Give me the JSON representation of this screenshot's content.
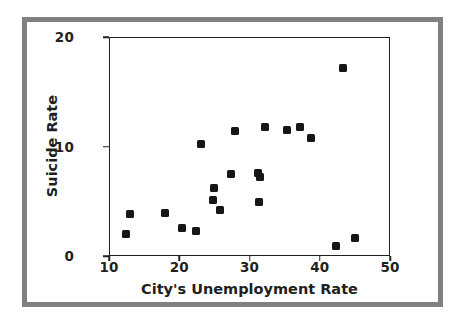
{
  "chart_data": {
    "type": "scatter",
    "title": "",
    "xlabel": "City's Unemployment Rate",
    "ylabel": "Suicide Rate",
    "xlim": [
      10,
      50
    ],
    "ylim": [
      0,
      20
    ],
    "xticks": [
      10,
      20,
      30,
      40,
      50
    ],
    "yticks": [
      0,
      10,
      20
    ],
    "xtick_labels": [
      "10",
      "20",
      "30",
      "40",
      "50"
    ],
    "ytick_labels": [
      "0",
      "10",
      "20"
    ],
    "grid": false,
    "legend": null,
    "marker": "square",
    "marker_color": "#161616",
    "points": [
      {
        "x": 12.4,
        "y": 2.0
      },
      {
        "x": 13.0,
        "y": 3.8
      },
      {
        "x": 18.0,
        "y": 3.9
      },
      {
        "x": 20.4,
        "y": 2.6
      },
      {
        "x": 22.4,
        "y": 2.3
      },
      {
        "x": 23.1,
        "y": 10.2
      },
      {
        "x": 24.8,
        "y": 5.1
      },
      {
        "x": 24.9,
        "y": 6.2
      },
      {
        "x": 25.8,
        "y": 4.2
      },
      {
        "x": 27.4,
        "y": 7.5
      },
      {
        "x": 27.9,
        "y": 11.4
      },
      {
        "x": 31.2,
        "y": 7.6
      },
      {
        "x": 31.5,
        "y": 7.2
      },
      {
        "x": 31.4,
        "y": 4.9
      },
      {
        "x": 32.2,
        "y": 11.8
      },
      {
        "x": 35.3,
        "y": 11.5
      },
      {
        "x": 37.2,
        "y": 11.8
      },
      {
        "x": 38.8,
        "y": 10.8
      },
      {
        "x": 42.3,
        "y": 0.9
      },
      {
        "x": 43.3,
        "y": 17.2
      },
      {
        "x": 45.0,
        "y": 1.6
      }
    ]
  },
  "colors": {
    "frame": "#808080",
    "axis": "#231f20",
    "marker": "#161616",
    "background": "#ffffff"
  }
}
